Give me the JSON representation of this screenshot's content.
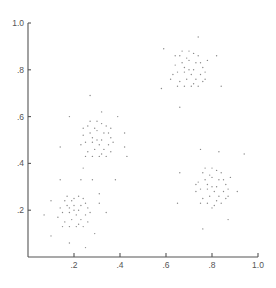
{
  "chart_data": {
    "type": "scatter",
    "title": "",
    "xlabel": "",
    "ylabel": "",
    "xlim": [
      0,
      1.0
    ],
    "ylim": [
      0,
      1.0
    ],
    "grid": false,
    "legend": null,
    "x_ticks": [
      ".2",
      ".4",
      ".6",
      ".8",
      "1.0"
    ],
    "y_ticks": [
      ".2",
      ".4",
      ".6",
      ".8",
      "1.0"
    ],
    "colors": {
      "axis": "#555555",
      "point": "#8a8a8a"
    },
    "series": [
      {
        "name": "cluster-bottom-left",
        "center": [
          0.2,
          0.2
        ],
        "points": [
          [
            0.2,
            0.2
          ],
          [
            0.17,
            0.22
          ],
          [
            0.23,
            0.22
          ],
          [
            0.15,
            0.19
          ],
          [
            0.25,
            0.18
          ],
          [
            0.19,
            0.16
          ],
          [
            0.22,
            0.14
          ],
          [
            0.16,
            0.24
          ],
          [
            0.24,
            0.25
          ],
          [
            0.2,
            0.25
          ],
          [
            0.18,
            0.13
          ],
          [
            0.26,
            0.21
          ],
          [
            0.14,
            0.21
          ],
          [
            0.21,
            0.18
          ],
          [
            0.18,
            0.19
          ],
          [
            0.23,
            0.16
          ],
          [
            0.16,
            0.15
          ],
          [
            0.26,
            0.15
          ],
          [
            0.2,
            0.22
          ],
          [
            0.13,
            0.17
          ],
          [
            0.22,
            0.26
          ],
          [
            0.17,
            0.26
          ],
          [
            0.25,
            0.23
          ],
          [
            0.19,
            0.24
          ],
          [
            0.21,
            0.13
          ],
          [
            0.15,
            0.13
          ],
          [
            0.27,
            0.19
          ],
          [
            0.24,
            0.13
          ],
          [
            0.18,
            0.21
          ],
          [
            0.22,
            0.2
          ],
          [
            0.1,
            0.24
          ],
          [
            0.07,
            0.18
          ],
          [
            0.1,
            0.09
          ],
          [
            0.18,
            0.06
          ],
          [
            0.25,
            0.04
          ],
          [
            0.29,
            0.1
          ],
          [
            0.14,
            0.33
          ],
          [
            0.23,
            0.33
          ],
          [
            0.28,
            0.33
          ],
          [
            0.31,
            0.27
          ],
          [
            0.31,
            0.23
          ],
          [
            0.34,
            0.19
          ]
        ]
      },
      {
        "name": "cluster-top-left",
        "center": [
          0.3,
          0.5
        ],
        "points": [
          [
            0.3,
            0.5
          ],
          [
            0.27,
            0.53
          ],
          [
            0.33,
            0.53
          ],
          [
            0.25,
            0.49
          ],
          [
            0.35,
            0.48
          ],
          [
            0.29,
            0.46
          ],
          [
            0.32,
            0.44
          ],
          [
            0.26,
            0.56
          ],
          [
            0.34,
            0.56
          ],
          [
            0.3,
            0.58
          ],
          [
            0.28,
            0.43
          ],
          [
            0.36,
            0.51
          ],
          [
            0.24,
            0.52
          ],
          [
            0.31,
            0.48
          ],
          [
            0.28,
            0.49
          ],
          [
            0.33,
            0.46
          ],
          [
            0.26,
            0.45
          ],
          [
            0.36,
            0.45
          ],
          [
            0.3,
            0.54
          ],
          [
            0.23,
            0.48
          ],
          [
            0.32,
            0.57
          ],
          [
            0.27,
            0.58
          ],
          [
            0.35,
            0.53
          ],
          [
            0.29,
            0.55
          ],
          [
            0.31,
            0.43
          ],
          [
            0.25,
            0.43
          ],
          [
            0.37,
            0.49
          ],
          [
            0.34,
            0.43
          ],
          [
            0.28,
            0.51
          ],
          [
            0.32,
            0.5
          ],
          [
            0.24,
            0.55
          ],
          [
            0.36,
            0.55
          ],
          [
            0.27,
            0.69
          ],
          [
            0.32,
            0.62
          ],
          [
            0.18,
            0.6
          ],
          [
            0.39,
            0.6
          ],
          [
            0.42,
            0.53
          ],
          [
            0.42,
            0.47
          ],
          [
            0.43,
            0.43
          ],
          [
            0.14,
            0.47
          ],
          [
            0.24,
            0.38
          ],
          [
            0.38,
            0.33
          ]
        ]
      },
      {
        "name": "cluster-top-right",
        "center": [
          0.7,
          0.8
        ],
        "points": [
          [
            0.7,
            0.8
          ],
          [
            0.67,
            0.83
          ],
          [
            0.73,
            0.83
          ],
          [
            0.65,
            0.79
          ],
          [
            0.75,
            0.78
          ],
          [
            0.69,
            0.76
          ],
          [
            0.72,
            0.74
          ],
          [
            0.66,
            0.86
          ],
          [
            0.74,
            0.86
          ],
          [
            0.7,
            0.88
          ],
          [
            0.68,
            0.73
          ],
          [
            0.76,
            0.81
          ],
          [
            0.64,
            0.82
          ],
          [
            0.71,
            0.78
          ],
          [
            0.68,
            0.79
          ],
          [
            0.73,
            0.76
          ],
          [
            0.66,
            0.75
          ],
          [
            0.76,
            0.75
          ],
          [
            0.7,
            0.84
          ],
          [
            0.63,
            0.78
          ],
          [
            0.72,
            0.87
          ],
          [
            0.67,
            0.88
          ],
          [
            0.75,
            0.83
          ],
          [
            0.69,
            0.85
          ],
          [
            0.71,
            0.73
          ],
          [
            0.65,
            0.73
          ],
          [
            0.77,
            0.79
          ],
          [
            0.74,
            0.73
          ],
          [
            0.68,
            0.81
          ],
          [
            0.72,
            0.8
          ],
          [
            0.62,
            0.76
          ],
          [
            0.78,
            0.84
          ],
          [
            0.64,
            0.86
          ],
          [
            0.77,
            0.76
          ],
          [
            0.59,
            0.89
          ],
          [
            0.74,
            0.94
          ],
          [
            0.58,
            0.72
          ],
          [
            0.66,
            0.64
          ],
          [
            0.82,
            0.86
          ],
          [
            0.84,
            0.73
          ]
        ]
      },
      {
        "name": "cluster-bottom-right",
        "center": [
          0.8,
          0.3
        ],
        "points": [
          [
            0.8,
            0.3
          ],
          [
            0.77,
            0.33
          ],
          [
            0.83,
            0.33
          ],
          [
            0.75,
            0.29
          ],
          [
            0.85,
            0.28
          ],
          [
            0.79,
            0.26
          ],
          [
            0.82,
            0.24
          ],
          [
            0.76,
            0.36
          ],
          [
            0.84,
            0.36
          ],
          [
            0.8,
            0.38
          ],
          [
            0.78,
            0.23
          ],
          [
            0.86,
            0.31
          ],
          [
            0.74,
            0.32
          ],
          [
            0.81,
            0.28
          ],
          [
            0.78,
            0.29
          ],
          [
            0.83,
            0.26
          ],
          [
            0.76,
            0.25
          ],
          [
            0.86,
            0.25
          ],
          [
            0.8,
            0.34
          ],
          [
            0.73,
            0.28
          ],
          [
            0.82,
            0.37
          ],
          [
            0.77,
            0.38
          ],
          [
            0.85,
            0.33
          ],
          [
            0.79,
            0.35
          ],
          [
            0.81,
            0.22
          ],
          [
            0.75,
            0.23
          ],
          [
            0.87,
            0.29
          ],
          [
            0.84,
            0.23
          ],
          [
            0.78,
            0.31
          ],
          [
            0.82,
            0.3
          ],
          [
            0.88,
            0.34
          ],
          [
            0.73,
            0.31
          ],
          [
            0.87,
            0.26
          ],
          [
            0.8,
            0.21
          ],
          [
            0.75,
            0.46
          ],
          [
            0.83,
            0.45
          ],
          [
            0.94,
            0.44
          ],
          [
            0.66,
            0.36
          ],
          [
            0.65,
            0.23
          ],
          [
            0.91,
            0.28
          ],
          [
            0.87,
            0.16
          ],
          [
            0.76,
            0.12
          ]
        ]
      }
    ]
  }
}
